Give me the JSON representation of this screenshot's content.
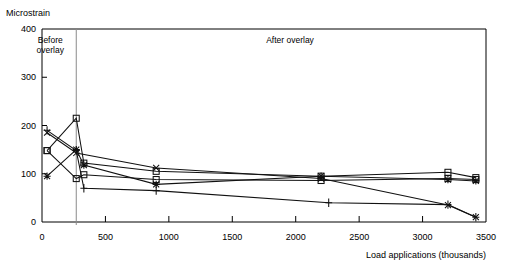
{
  "axis_label_y": "Microstrain",
  "axis_label_x": "Load applications (thousands)",
  "annotations": {
    "before": "Before\noverlay",
    "before_line1": "Before",
    "before_line2": "overlay",
    "after": "After overlay"
  },
  "chart_data": {
    "type": "line",
    "title": "",
    "xlabel": "Load applications (thousands)",
    "ylabel": "Microstrain",
    "xlim": [
      0,
      3500
    ],
    "ylim": [
      0,
      400
    ],
    "xticks": [
      0,
      500,
      1000,
      1500,
      2000,
      2500,
      3000,
      3500
    ],
    "yticks": [
      0,
      100,
      200,
      300,
      400
    ],
    "grid": false,
    "legend": "none",
    "divider_x": 270,
    "region_labels": [
      "Before overlay",
      "After overlay"
    ],
    "series": [
      {
        "name": "Series 1",
        "marker": "square",
        "x": [
          40,
          270,
          330,
          900,
          2200,
          3200,
          3420
        ],
        "y": [
          148,
          215,
          122,
          105,
          95,
          103,
          92
        ]
      },
      {
        "name": "Series 2",
        "marker": "square",
        "x": [
          40,
          270,
          330,
          900,
          2200,
          3200,
          3420
        ],
        "y": [
          148,
          90,
          98,
          88,
          86,
          90,
          88
        ]
      },
      {
        "name": "Series 3",
        "marker": "asterisk",
        "x": [
          40,
          270,
          330,
          900,
          2200,
          3200,
          3420
        ],
        "y": [
          95,
          150,
          118,
          78,
          95,
          88,
          85
        ]
      },
      {
        "name": "Series 4",
        "marker": "cross",
        "x": [
          40,
          270,
          330,
          900,
          2260,
          3200,
          3420
        ],
        "y": [
          190,
          148,
          70,
          65,
          40,
          36,
          10
        ]
      },
      {
        "name": "Series 5",
        "marker": "x",
        "x": [
          40,
          270,
          900,
          2200,
          3200,
          3420
        ],
        "y": [
          185,
          143,
          112,
          90,
          35,
          10
        ]
      }
    ]
  }
}
